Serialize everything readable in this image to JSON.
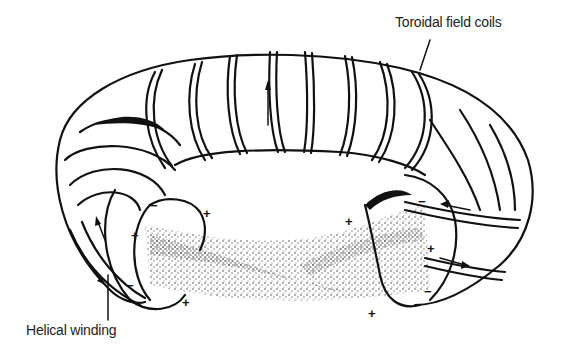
{
  "diagram": {
    "labels": {
      "toroidal_field_coils": "Toroidal field coils",
      "helical_winding": "Helical winding"
    },
    "polarity_marks": [
      "+",
      "-",
      "+",
      "+",
      "-",
      "+",
      "+",
      "+",
      "-",
      "-",
      "+"
    ],
    "colors": {
      "line": "#111111",
      "background": "#ffffff",
      "plasma_stipple": "#333333"
    }
  }
}
